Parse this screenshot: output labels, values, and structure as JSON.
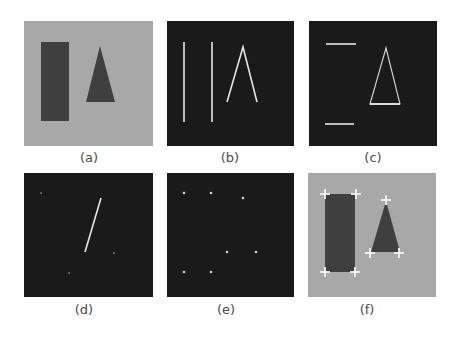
{
  "figure": {
    "colors": {
      "light_background": "#a8a8a8",
      "dark_background": "#1a1a1a",
      "shape_fill": "#3f3f3f",
      "line_color": "#e6e6e6",
      "marker_color": "#f4f4f4"
    },
    "panels": [
      {
        "id": "a",
        "caption": "(a)",
        "description": "gray image with dark rectangle and dark triangle"
      },
      {
        "id": "b",
        "caption": "(b)",
        "description": "dark image with two vertical edge lines and inverted-V triangle edges"
      },
      {
        "id": "c",
        "caption": "(c)",
        "description": "dark image with two horizontal edge lines and triangle outline"
      },
      {
        "id": "d",
        "caption": "(d)",
        "description": "dark image with single diagonal line and faint dots"
      },
      {
        "id": "e",
        "caption": "(e)",
        "description": "dark image with seven corner points"
      },
      {
        "id": "f",
        "caption": "(f)",
        "description": "gray image with shapes and cross markers at detected corners"
      }
    ]
  }
}
